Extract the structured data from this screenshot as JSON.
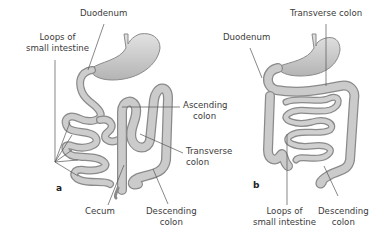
{
  "figure": {
    "panels": [
      {
        "id": "a",
        "letter": "a",
        "labels": {
          "duodenum": "Duodenum",
          "loops_line1": "Loops of",
          "loops_line2": "small intestine",
          "ascending_line1": "Ascending",
          "ascending_line2": "colon",
          "transverse_line1": "Transverse",
          "transverse_line2": "colon",
          "cecum": "Cecum",
          "descending_line1": "Descending",
          "descending_line2": "colon"
        }
      },
      {
        "id": "b",
        "letter": "b",
        "labels": {
          "transverse": "Transverse colon",
          "duodenum": "Duodenum",
          "loops_line1": "Loops of",
          "loops_line2": "small intestine",
          "descending_line1": "Descending",
          "descending_line2": "colon"
        }
      }
    ],
    "colors": {
      "organ_fill": "#c9c9c9",
      "organ_stroke": "#8a8a8a",
      "leader_line": "#555555",
      "text": "#3a3a3a"
    }
  }
}
